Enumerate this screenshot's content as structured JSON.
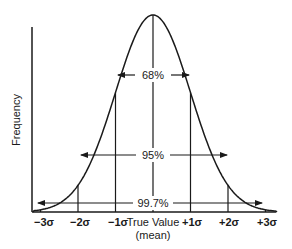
{
  "diagram": {
    "type": "normal-distribution",
    "y_axis_label": "Frequency",
    "x_axis_label": "True Value",
    "x_axis_sublabel": "(mean)",
    "sigma_ticks": [
      {
        "label": "−3σ",
        "sigma": -3
      },
      {
        "label": "−2σ",
        "sigma": -2
      },
      {
        "label": "−1σ",
        "sigma": -1
      },
      {
        "label": "+1σ",
        "sigma": 1
      },
      {
        "label": "+2σ",
        "sigma": 2
      },
      {
        "label": "+3σ",
        "sigma": 3
      }
    ],
    "ranges": [
      {
        "label": "68%",
        "from_sigma": -1,
        "to_sigma": 1
      },
      {
        "label": "95%",
        "from_sigma": -2,
        "to_sigma": 2
      },
      {
        "label": "99.7%",
        "from_sigma": -3,
        "to_sigma": 3
      }
    ],
    "line_color": "#1a1a1a",
    "background_color": "#ffffff"
  }
}
